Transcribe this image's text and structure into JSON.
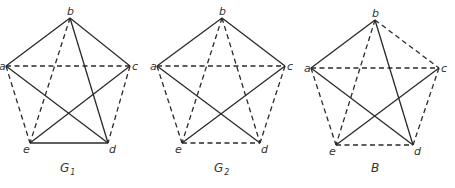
{
  "figure": {
    "type": "complete graph K5 decompositions",
    "edge_styles": {
      "solid": "solid line",
      "dashed": "dashed line"
    },
    "graphs": [
      {
        "id": "G1",
        "caption_main": "G",
        "caption_sub": "1",
        "vertices": {
          "a": {
            "label": "a",
            "x": 6,
            "y": 66
          },
          "b": {
            "label": "b",
            "x": 70,
            "y": 18
          },
          "c": {
            "label": "c",
            "x": 130,
            "y": 66
          },
          "d": {
            "label": "d",
            "x": 108,
            "y": 143
          },
          "e": {
            "label": "e",
            "x": 30,
            "y": 143
          }
        },
        "solid_edges": [
          [
            "a",
            "b"
          ],
          [
            "b",
            "c"
          ],
          [
            "b",
            "d"
          ],
          [
            "a",
            "d"
          ],
          [
            "c",
            "e"
          ],
          [
            "e",
            "d"
          ]
        ],
        "dashed_edges": [
          [
            "a",
            "c"
          ],
          [
            "a",
            "e"
          ],
          [
            "b",
            "e"
          ],
          [
            "c",
            "d"
          ]
        ],
        "caption_pos": {
          "x": 60,
          "y": 172
        }
      },
      {
        "id": "G2",
        "caption_main": "G",
        "caption_sub": "2",
        "vertices": {
          "a": {
            "label": "a",
            "x": 157,
            "y": 66
          },
          "b": {
            "label": "b",
            "x": 222,
            "y": 18
          },
          "c": {
            "label": "c",
            "x": 285,
            "y": 66
          },
          "d": {
            "label": "d",
            "x": 260,
            "y": 143
          },
          "e": {
            "label": "e",
            "x": 182,
            "y": 143
          }
        },
        "solid_edges": [
          [
            "a",
            "b"
          ],
          [
            "b",
            "c"
          ],
          [
            "a",
            "d"
          ],
          [
            "c",
            "e"
          ]
        ],
        "dashed_edges": [
          [
            "a",
            "c"
          ],
          [
            "a",
            "e"
          ],
          [
            "b",
            "e"
          ],
          [
            "b",
            "d"
          ],
          [
            "c",
            "d"
          ],
          [
            "e",
            "d"
          ]
        ],
        "caption_pos": {
          "x": 214,
          "y": 172
        }
      },
      {
        "id": "B",
        "caption_main": "B",
        "caption_sub": "",
        "vertices": {
          "a": {
            "label": "a",
            "x": 311,
            "y": 68
          },
          "b": {
            "label": "b",
            "x": 375,
            "y": 20
          },
          "c": {
            "label": "c",
            "x": 439,
            "y": 68
          },
          "d": {
            "label": "d",
            "x": 413,
            "y": 145
          },
          "e": {
            "label": "e",
            "x": 336,
            "y": 145
          }
        },
        "solid_edges": [
          [
            "a",
            "b"
          ],
          [
            "b",
            "d"
          ],
          [
            "a",
            "d"
          ],
          [
            "c",
            "e"
          ]
        ],
        "dashed_edges": [
          [
            "b",
            "c"
          ],
          [
            "a",
            "c"
          ],
          [
            "a",
            "e"
          ],
          [
            "b",
            "e"
          ],
          [
            "c",
            "d"
          ],
          [
            "e",
            "d"
          ]
        ],
        "caption_pos": {
          "x": 371,
          "y": 172
        }
      }
    ]
  }
}
